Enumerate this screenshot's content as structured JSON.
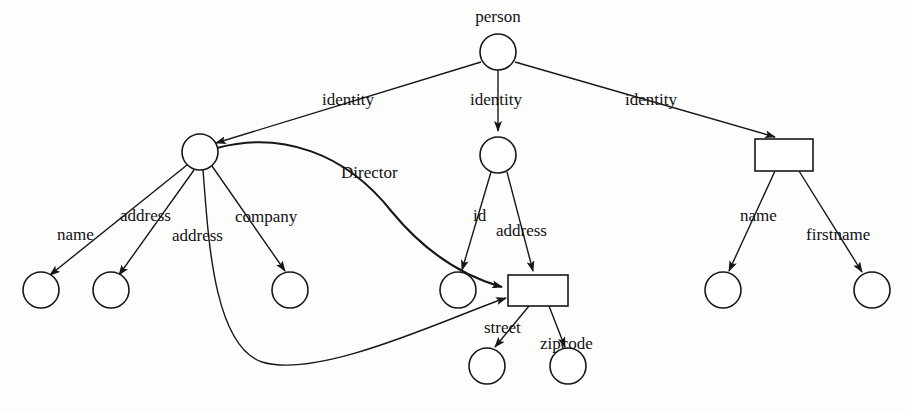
{
  "diagram": {
    "type": "tree-graph",
    "title": "person",
    "background_color": "#fdfdfc",
    "stroke_color": "#17171a",
    "fill_color": "#ffffff",
    "root_label": "person",
    "nodes": [
      {
        "id": "person",
        "shape": "circle",
        "label": "person",
        "cx": 498,
        "cy": 52,
        "r": 18
      },
      {
        "id": "left_rec",
        "shape": "circle",
        "label": "",
        "cx": 200,
        "cy": 152,
        "r": 18
      },
      {
        "id": "mid_rec",
        "shape": "circle",
        "label": "",
        "cx": 498,
        "cy": 155,
        "r": 18
      },
      {
        "id": "right_rec",
        "shape": "rect",
        "label": "",
        "x": 755,
        "y": 139,
        "w": 58,
        "h": 32
      },
      {
        "id": "l_name",
        "shape": "circle",
        "label": "",
        "cx": 41,
        "cy": 290,
        "r": 18
      },
      {
        "id": "l_addr1",
        "shape": "circle",
        "label": "",
        "cx": 111,
        "cy": 290,
        "r": 18
      },
      {
        "id": "l_company",
        "shape": "circle",
        "label": "",
        "cx": 290,
        "cy": 290,
        "r": 18
      },
      {
        "id": "m_id",
        "shape": "circle",
        "label": "",
        "cx": 458,
        "cy": 290,
        "r": 18
      },
      {
        "id": "m_addr",
        "shape": "rect",
        "label": "",
        "x": 508,
        "y": 275,
        "w": 60,
        "h": 31
      },
      {
        "id": "m_street",
        "shape": "circle",
        "label": "",
        "cx": 487,
        "cy": 366,
        "r": 18
      },
      {
        "id": "m_zipcode",
        "shape": "circle",
        "label": "",
        "cx": 568,
        "cy": 366,
        "r": 18
      },
      {
        "id": "r_name",
        "shape": "circle",
        "label": "",
        "cx": 723,
        "cy": 290,
        "r": 18
      },
      {
        "id": "r_firstname",
        "shape": "circle",
        "label": "",
        "cx": 872,
        "cy": 290,
        "r": 18
      }
    ],
    "edges": [
      {
        "id": "e1",
        "from": "person",
        "to": "left_rec",
        "label": "identity",
        "label_x": 322,
        "label_y": 105,
        "arrow": true,
        "curved": false
      },
      {
        "id": "e2",
        "from": "person",
        "to": "mid_rec",
        "label": "identity",
        "label_x": 470,
        "label_y": 105,
        "arrow": true,
        "curved": false
      },
      {
        "id": "e3",
        "from": "person",
        "to": "right_rec",
        "label": "identity",
        "label_x": 625,
        "label_y": 105,
        "arrow": true,
        "curved": false
      },
      {
        "id": "e4",
        "from": "left_rec",
        "to": "l_name",
        "label": "name",
        "label_x": 57,
        "label_y": 240,
        "arrow": true,
        "curved": false
      },
      {
        "id": "e5",
        "from": "left_rec",
        "to": "l_addr1",
        "label": "address",
        "label_x": 120,
        "label_y": 221,
        "arrow": true,
        "curved": false
      },
      {
        "id": "e6",
        "from": "left_rec",
        "to": "m_addr",
        "label": "address",
        "label_x": 172,
        "label_y": 241,
        "arrow": true,
        "curved": true
      },
      {
        "id": "e7",
        "from": "left_rec",
        "to": "l_company",
        "label": "company",
        "label_x": 235,
        "label_y": 222,
        "arrow": true,
        "curved": false
      },
      {
        "id": "e8",
        "from": "left_rec",
        "to": "m_addr",
        "label": "Director",
        "label_x": 341,
        "label_y": 178,
        "arrow": true,
        "curved": true
      },
      {
        "id": "e9",
        "from": "mid_rec",
        "to": "m_id",
        "label": "id",
        "label_x": 473,
        "label_y": 221,
        "arrow": true,
        "curved": false
      },
      {
        "id": "e10",
        "from": "mid_rec",
        "to": "m_addr",
        "label": "address",
        "label_x": 496,
        "label_y": 236,
        "arrow": true,
        "curved": false
      },
      {
        "id": "e11",
        "from": "m_addr",
        "to": "m_street",
        "label": "street",
        "label_x": 484,
        "label_y": 333,
        "arrow": true,
        "curved": false
      },
      {
        "id": "e12",
        "from": "m_addr",
        "to": "m_zipcode",
        "label": "zipcode",
        "label_x": 540,
        "label_y": 349,
        "arrow": true,
        "curved": false
      },
      {
        "id": "e13",
        "from": "right_rec",
        "to": "r_name",
        "label": "name",
        "label_x": 740,
        "label_y": 221,
        "arrow": true,
        "curved": false
      },
      {
        "id": "e14",
        "from": "right_rec",
        "to": "r_firstname",
        "label": "firstname",
        "label_x": 806,
        "label_y": 240,
        "arrow": true,
        "curved": false
      }
    ],
    "paths": {
      "e1": "M 481 62 L 216 143",
      "e2": "M 498 70 L 498 131",
      "e3": "M 515 62 L 775 137",
      "e4": "M 187 165 L 50 275",
      "e5": "M 194 170 L 119 275",
      "e6": "M 203 170 C 208 230, 212 345, 262 362 C 320 380, 452 316, 506 298",
      "e7": "M 212 166 L 285 271",
      "e8": "M 217 148 C 280 131, 345 152, 392 212 C 430 258, 470 278, 502 287",
      "e9": "M 491 172 L 462 270",
      "e10": "M 507 172 L 533 271",
      "e11": "M 529 306 L 495 347",
      "e12": "M 549 306 L 565 347",
      "e13": "M 775 171 L 729 271",
      "e14": "M 799 171 L 862 272"
    },
    "labels": {
      "person": "person",
      "identity": "identity",
      "name": "name",
      "address": "address",
      "company": "company",
      "director": "Director",
      "id": "id",
      "street": "street",
      "zipcode": "zipcode",
      "firstname": "firstname"
    }
  }
}
